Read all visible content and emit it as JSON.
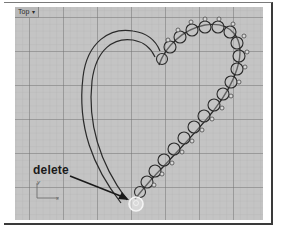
{
  "viewport": {
    "name": "Top",
    "menu_caret": "▾",
    "background": "#c4c4c4",
    "grid": {
      "minor_spacing_px": 6.8,
      "major_spacing_px": 34,
      "major_origin": [
        14,
        10
      ],
      "minor_color": "#b2b2b2",
      "major_color": "#6e6e6e"
    }
  },
  "annotation": {
    "label": "delete",
    "arrow_color": "#1a1a1a"
  },
  "axes": {
    "y_label": "y",
    "x_label": "x"
  },
  "colors": {
    "curve": "#2a2a2a",
    "highlight_circle": "#f2f2f2"
  }
}
